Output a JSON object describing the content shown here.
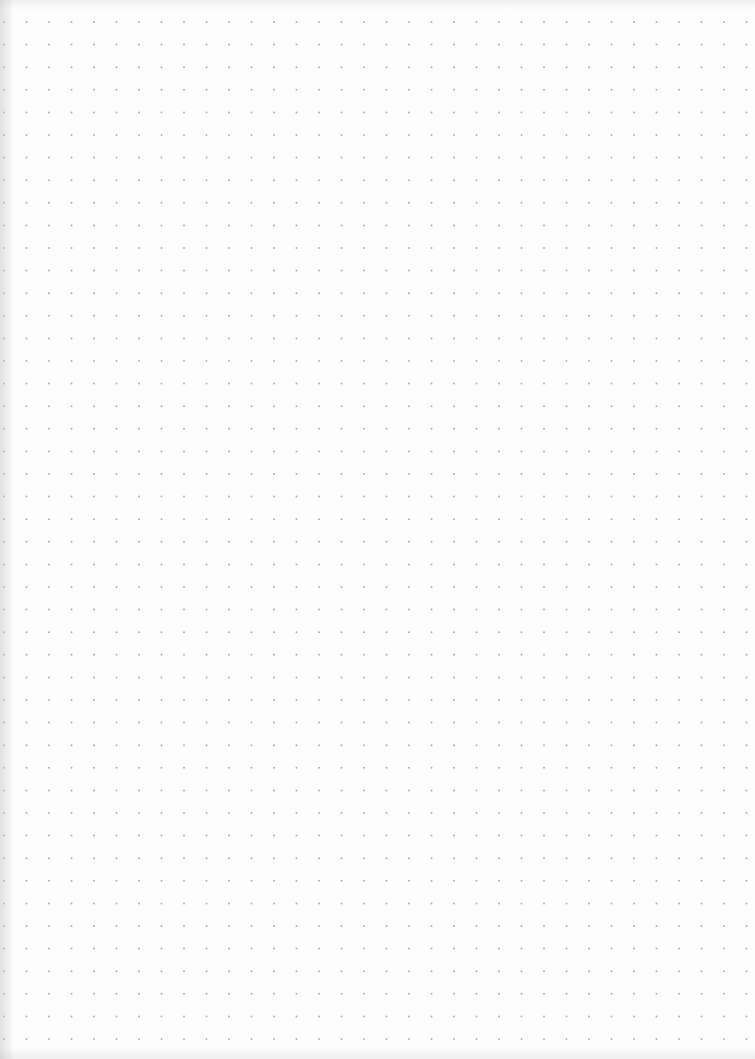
{
  "page": {
    "type": "dot-grid notebook page",
    "background_color": "#fdfdfd",
    "dot_color": "#b8b8b8",
    "edge_shadow_color": "#c8c8c8"
  },
  "grid": {
    "columns": 34,
    "rows": 46,
    "origin_x": 4,
    "origin_y": 22,
    "spacing_x": 22.5,
    "spacing_y": 22.6,
    "dot_radius": 1
  }
}
